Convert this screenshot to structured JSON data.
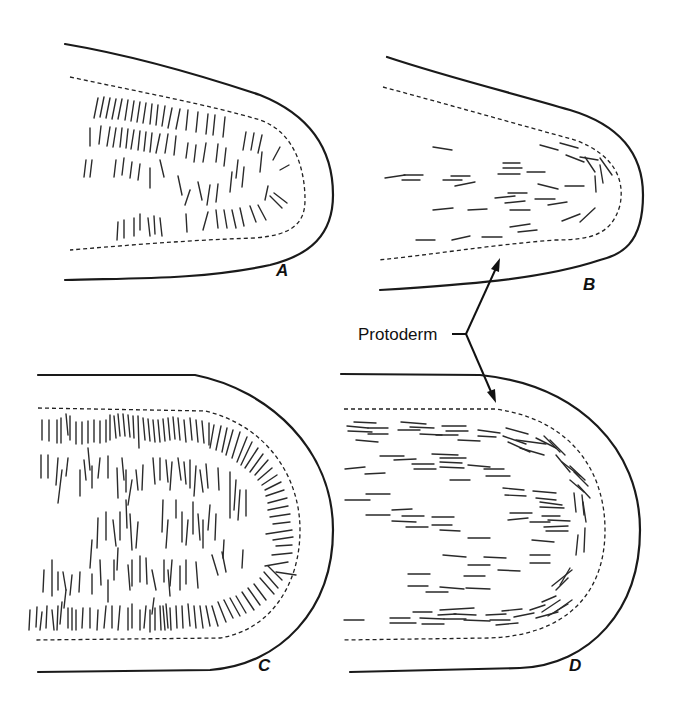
{
  "figure": {
    "type": "botanical-diagram",
    "panels": [
      {
        "id": "A",
        "label": "A",
        "division_orientation": "anticlinal (vertical lines, dense)"
      },
      {
        "id": "B",
        "label": "B",
        "division_orientation": "periclinal (horizontal lines, sparse)"
      },
      {
        "id": "C",
        "label": "C",
        "division_orientation": "anticlinal (vertical lines, very dense, radial at tip)"
      },
      {
        "id": "D",
        "label": "D",
        "division_orientation": "periclinal (horizontal lines, concentric at tip)"
      }
    ],
    "annotation": {
      "label": "Protoderm",
      "targets": [
        "B",
        "D"
      ]
    }
  }
}
